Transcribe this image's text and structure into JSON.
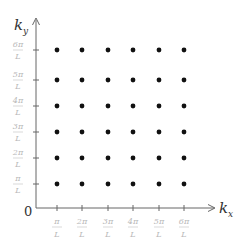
{
  "diagram": {
    "origin_label": "0",
    "x_axis": {
      "label": "k",
      "subscript": "x"
    },
    "y_axis": {
      "label": "k",
      "subscript": "y"
    },
    "x_ticks": [
      {
        "num": "π",
        "den": "L"
      },
      {
        "num": "2π",
        "den": "L"
      },
      {
        "num": "3π",
        "den": "L"
      },
      {
        "num": "4π",
        "den": "L"
      },
      {
        "num": "5π",
        "den": "L"
      },
      {
        "num": "6π",
        "den": "L"
      }
    ],
    "y_ticks": [
      {
        "num": "π",
        "den": "L"
      },
      {
        "num": "2π",
        "den": "L"
      },
      {
        "num": "3π",
        "den": "L"
      },
      {
        "num": "4π",
        "den": "L"
      },
      {
        "num": "5π",
        "den": "L"
      },
      {
        "num": "6π",
        "den": "L"
      }
    ],
    "grid_points": {
      "rows": 6,
      "cols": 6
    },
    "colors": {
      "axis": "#555555",
      "dot": "#111111",
      "tick_label": "#b8b8b8"
    }
  }
}
